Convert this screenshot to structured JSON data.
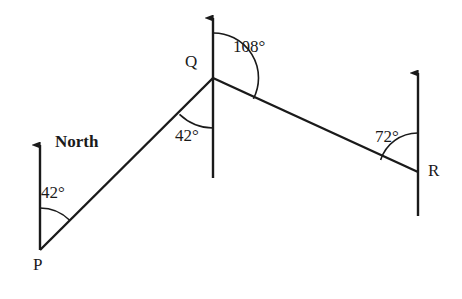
{
  "diagram": {
    "stroke_color": "#1a1a1a",
    "background_color": "#ffffff",
    "vertices": [
      {
        "id": "P",
        "label": "P",
        "x": 40,
        "y": 250
      },
      {
        "id": "Q",
        "label": "Q",
        "x": 213,
        "y": 78
      },
      {
        "id": "R",
        "label": "R",
        "x": 418,
        "y": 172
      }
    ],
    "north_label": "North",
    "angles": [
      {
        "id": "angle-p",
        "label": "42°",
        "value": 42,
        "at": "P"
      },
      {
        "id": "angle-q-west",
        "label": "42°",
        "value": 42,
        "at": "Q"
      },
      {
        "id": "angle-q-north",
        "label": "108°",
        "value": 108,
        "at": "Q"
      },
      {
        "id": "angle-r",
        "label": "72°",
        "value": 72,
        "at": "R"
      }
    ],
    "segments": [
      {
        "id": "segment-PQ",
        "from": "P",
        "to": "Q"
      },
      {
        "id": "segment-QR",
        "from": "Q",
        "to": "R"
      }
    ],
    "north_arrows": [
      {
        "id": "north-arrow-p",
        "at": "P",
        "tip_x": 40,
        "tip_y": 140
      },
      {
        "id": "north-arrow-q",
        "at": "Q",
        "tip_x": 213,
        "tip_y": 13
      },
      {
        "id": "north-arrow-r",
        "at": "R",
        "tip_x": 418,
        "tip_y": 68
      }
    ]
  }
}
